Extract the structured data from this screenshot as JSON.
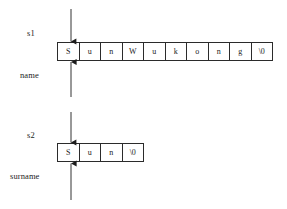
{
  "figure": {
    "background_color": "#ffffff",
    "line_color": "#2b2b2b",
    "text_color": "#1c1c1c"
  },
  "diagrams": [
    {
      "id": "name-string",
      "pointer_label": "s1",
      "array_label": "name",
      "cells": [
        "S",
        "u",
        "n",
        "W",
        "u",
        "k",
        "o",
        "n",
        "g",
        "\\0"
      ],
      "cell_count": 10,
      "pointer_arrow_direction": "down",
      "array_arrow_direction": "up"
    },
    {
      "id": "surname-string",
      "pointer_label": "s2",
      "array_label": "surname",
      "cells": [
        "S",
        "u",
        "n",
        "\\0"
      ],
      "cell_count": 4,
      "pointer_arrow_direction": "down",
      "array_arrow_direction": "up"
    }
  ]
}
